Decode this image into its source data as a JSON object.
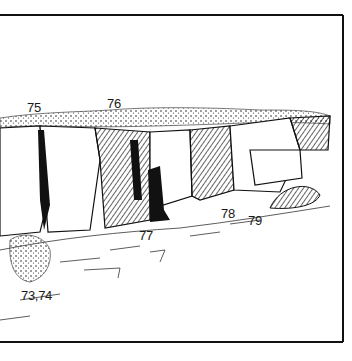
{
  "figure": {
    "type": "crag topo line drawing",
    "frame": {
      "top": 15,
      "right": 343,
      "bottom": 342,
      "stroke": "#111111"
    }
  },
  "route_labels": [
    {
      "text": "75",
      "x": 27,
      "y": 101
    },
    {
      "text": "76",
      "x": 107,
      "y": 97
    },
    {
      "text": "77",
      "x": 139,
      "y": 229
    },
    {
      "text": "78",
      "x": 221,
      "y": 207
    },
    {
      "text": "79",
      "x": 248,
      "y": 214
    },
    {
      "text": "73,74",
      "x": 21,
      "y": 289
    }
  ],
  "colors": {
    "ink": "#111111",
    "paper": "#ffffff",
    "shade": "#2a2a2a"
  }
}
